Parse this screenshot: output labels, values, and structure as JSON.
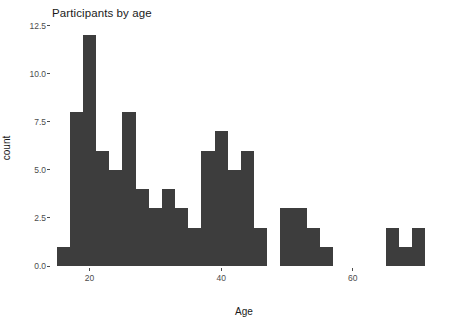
{
  "chart_data": {
    "type": "bar",
    "title": "Participants by age",
    "xlabel": "Age",
    "ylabel": "count",
    "xlim": [
      14,
      74
    ],
    "ylim": [
      0,
      12.8
    ],
    "grid": false,
    "legend": null,
    "bin_width": 2,
    "x_ticks": [
      20,
      40,
      60
    ],
    "x_tick_labels": [
      "20",
      "40",
      "60"
    ],
    "y_ticks": [
      0.0,
      2.5,
      5.0,
      7.5,
      10.0,
      12.5
    ],
    "y_tick_labels": [
      "0.0",
      "2.5",
      "5.0",
      "7.5",
      "10.0",
      "12.5"
    ],
    "bar_color": "#3d3d3d",
    "bins": [
      {
        "x0": 15,
        "x1": 17,
        "center": 16,
        "value": 1
      },
      {
        "x0": 17,
        "x1": 19,
        "center": 18,
        "value": 8
      },
      {
        "x0": 19,
        "x1": 21,
        "center": 20,
        "value": 12
      },
      {
        "x0": 21,
        "x1": 23,
        "center": 22,
        "value": 6
      },
      {
        "x0": 23,
        "x1": 25,
        "center": 24,
        "value": 5
      },
      {
        "x0": 25,
        "x1": 27,
        "center": 26,
        "value": 8
      },
      {
        "x0": 27,
        "x1": 29,
        "center": 28,
        "value": 4
      },
      {
        "x0": 29,
        "x1": 31,
        "center": 30,
        "value": 3
      },
      {
        "x0": 31,
        "x1": 33,
        "center": 32,
        "value": 4
      },
      {
        "x0": 33,
        "x1": 35,
        "center": 34,
        "value": 3
      },
      {
        "x0": 35,
        "x1": 37,
        "center": 36,
        "value": 2
      },
      {
        "x0": 37,
        "x1": 39,
        "center": 38,
        "value": 6
      },
      {
        "x0": 39,
        "x1": 41,
        "center": 40,
        "value": 7
      },
      {
        "x0": 41,
        "x1": 43,
        "center": 42,
        "value": 5
      },
      {
        "x0": 43,
        "x1": 45,
        "center": 44,
        "value": 6
      },
      {
        "x0": 45,
        "x1": 47,
        "center": 46,
        "value": 2
      },
      {
        "x0": 47,
        "x1": 49,
        "center": 48,
        "value": 0
      },
      {
        "x0": 49,
        "x1": 51,
        "center": 50,
        "value": 3
      },
      {
        "x0": 51,
        "x1": 53,
        "center": 52,
        "value": 3
      },
      {
        "x0": 53,
        "x1": 55,
        "center": 54,
        "value": 2
      },
      {
        "x0": 55,
        "x1": 57,
        "center": 56,
        "value": 1
      },
      {
        "x0": 57,
        "x1": 59,
        "center": 58,
        "value": 0
      },
      {
        "x0": 59,
        "x1": 61,
        "center": 60,
        "value": 0
      },
      {
        "x0": 61,
        "x1": 63,
        "center": 62,
        "value": 0
      },
      {
        "x0": 63,
        "x1": 65,
        "center": 64,
        "value": 0
      },
      {
        "x0": 65,
        "x1": 67,
        "center": 66,
        "value": 2
      },
      {
        "x0": 67,
        "x1": 69,
        "center": 68,
        "value": 1
      },
      {
        "x0": 69,
        "x1": 71,
        "center": 70,
        "value": 2
      },
      {
        "x0": 71,
        "x1": 73,
        "center": 72,
        "value": 0
      }
    ]
  }
}
